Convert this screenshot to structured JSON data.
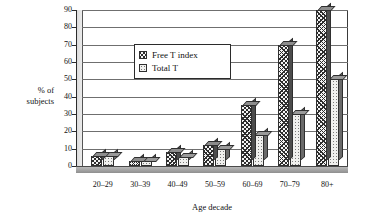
{
  "chart_data": {
    "type": "bar",
    "title": "",
    "xlabel": "Age decade",
    "ylabel": "% of subjects",
    "ylabel_line1": "% of",
    "ylabel_line2": "subjects",
    "categories": [
      "20–29",
      "30–39",
      "40–49",
      "50–59",
      "60–69",
      "70–79",
      "80+"
    ],
    "series": [
      {
        "name": "Free T index",
        "values": [
          6,
          3,
          8,
          12,
          35,
          70,
          90
        ],
        "pattern": "hatched"
      },
      {
        "name": "Total T",
        "values": [
          6,
          3,
          5,
          10,
          18,
          30,
          50
        ],
        "pattern": "dotted"
      }
    ],
    "ylim": [
      0,
      90
    ],
    "yticks": [
      0,
      10,
      20,
      30,
      40,
      50,
      60,
      70,
      80,
      90
    ],
    "ytick_labels": [
      "0",
      "10",
      "20",
      "30",
      "40",
      "50",
      "60",
      "70",
      "80",
      "90"
    ],
    "grid": true,
    "legend_position": "upper center",
    "style": "3d-column"
  },
  "legend": {
    "entries": [
      {
        "label": "Free T index"
      },
      {
        "label": "Total T"
      }
    ]
  }
}
